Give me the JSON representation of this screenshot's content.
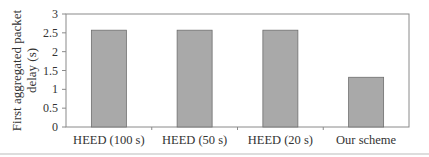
{
  "chart_data": {
    "type": "bar",
    "title": "",
    "xlabel": "",
    "ylabel": "First aggregated packet delay (s)",
    "ylabel_lines": [
      "First aggregated packet",
      "delay (s)"
    ],
    "categories": [
      "HEED (100 s)",
      "HEED (50 s)",
      "HEED (20 s)",
      "Our scheme"
    ],
    "values": [
      2.57,
      2.57,
      2.57,
      1.32
    ],
    "ylim": [
      0,
      3
    ],
    "yticks": [
      0,
      0.5,
      1,
      1.5,
      2,
      2.5,
      3
    ],
    "ytick_labels": [
      "0",
      "0.5",
      "1",
      "1.5",
      "2",
      "2.5",
      "3"
    ],
    "grid": false,
    "legend": null,
    "bar_color": "#a9a9a9",
    "bar_edge_color": "#6e6e6e"
  }
}
